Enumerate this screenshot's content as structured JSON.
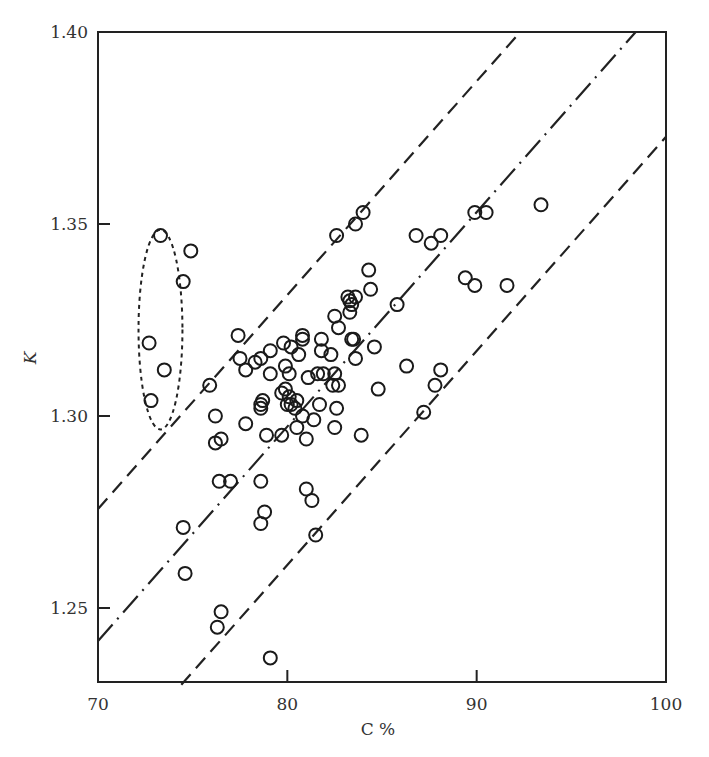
{
  "chart_data": {
    "type": "scatter",
    "title": "",
    "xlabel": "C %",
    "ylabel": "K",
    "xlim": [
      70,
      100
    ],
    "ylim": [
      1.23,
      1.4
    ],
    "x_ticks": [
      70,
      80,
      90,
      100
    ],
    "x_tick_labels": [
      "70",
      "80",
      "90",
      "100"
    ],
    "y_ticks": [
      1.25,
      1.3,
      1.35,
      1.4
    ],
    "y_tick_labels": [
      "1.25",
      "1.30",
      "1.35",
      "1.40"
    ],
    "grid": false,
    "legend": null,
    "marker": "open-circle",
    "series": [
      {
        "name": "outliers (circled)",
        "points": [
          [
            73.3,
            1.347
          ],
          [
            74.9,
            1.343
          ],
          [
            74.5,
            1.335
          ],
          [
            72.7,
            1.319
          ],
          [
            73.5,
            1.312
          ],
          [
            72.8,
            1.304
          ]
        ]
      },
      {
        "name": "data",
        "points": [
          [
            75.9,
            1.308
          ],
          [
            77.4,
            1.321
          ],
          [
            77.5,
            1.315
          ],
          [
            77.8,
            1.312
          ],
          [
            78.3,
            1.314
          ],
          [
            79.1,
            1.317
          ],
          [
            77.8,
            1.298
          ],
          [
            78.6,
            1.303
          ],
          [
            78.7,
            1.304
          ],
          [
            78.6,
            1.302
          ],
          [
            76.2,
            1.3
          ],
          [
            76.5,
            1.294
          ],
          [
            76.2,
            1.293
          ],
          [
            76.4,
            1.283
          ],
          [
            77.0,
            1.283
          ],
          [
            78.6,
            1.283
          ],
          [
            78.8,
            1.275
          ],
          [
            78.6,
            1.272
          ],
          [
            74.5,
            1.271
          ],
          [
            74.6,
            1.259
          ],
          [
            76.5,
            1.249
          ],
          [
            76.3,
            1.245
          ],
          [
            79.1,
            1.237
          ],
          [
            79.7,
            1.295
          ],
          [
            78.9,
            1.295
          ],
          [
            80.4,
            1.302
          ],
          [
            79.8,
            1.319
          ],
          [
            80.2,
            1.318
          ],
          [
            79.9,
            1.313
          ],
          [
            80.1,
            1.311
          ],
          [
            80.8,
            1.321
          ],
          [
            80.8,
            1.32
          ],
          [
            80.6,
            1.316
          ],
          [
            79.9,
            1.307
          ],
          [
            80.1,
            1.305
          ],
          [
            80.2,
            1.303
          ],
          [
            80.5,
            1.304
          ],
          [
            80.0,
            1.303
          ],
          [
            80.5,
            1.297
          ],
          [
            80.8,
            1.3
          ],
          [
            81.0,
            1.294
          ],
          [
            81.4,
            1.299
          ],
          [
            81.1,
            1.31
          ],
          [
            81.6,
            1.311
          ],
          [
            81.9,
            1.311
          ],
          [
            81.7,
            1.303
          ],
          [
            81.8,
            1.32
          ],
          [
            82.3,
            1.316
          ],
          [
            82.4,
            1.308
          ],
          [
            82.5,
            1.311
          ],
          [
            82.7,
            1.308
          ],
          [
            82.6,
            1.302
          ],
          [
            82.5,
            1.297
          ],
          [
            82.6,
            1.347
          ],
          [
            83.6,
            1.35
          ],
          [
            84.0,
            1.353
          ],
          [
            84.3,
            1.338
          ],
          [
            84.4,
            1.333
          ],
          [
            82.5,
            1.326
          ],
          [
            82.7,
            1.323
          ],
          [
            83.2,
            1.331
          ],
          [
            83.3,
            1.33
          ],
          [
            83.3,
            1.327
          ],
          [
            83.4,
            1.329
          ],
          [
            83.6,
            1.331
          ],
          [
            83.4,
            1.32
          ],
          [
            83.5,
            1.32
          ],
          [
            83.6,
            1.315
          ],
          [
            83.9,
            1.295
          ],
          [
            84.6,
            1.318
          ],
          [
            84.8,
            1.307
          ],
          [
            81.0,
            1.281
          ],
          [
            81.3,
            1.278
          ],
          [
            81.5,
            1.269
          ],
          [
            85.8,
            1.329
          ],
          [
            86.3,
            1.313
          ],
          [
            87.2,
            1.301
          ],
          [
            87.8,
            1.308
          ],
          [
            88.1,
            1.312
          ],
          [
            86.8,
            1.347
          ],
          [
            87.6,
            1.345
          ],
          [
            88.1,
            1.347
          ],
          [
            89.4,
            1.336
          ],
          [
            89.9,
            1.334
          ],
          [
            89.9,
            1.353
          ],
          [
            90.5,
            1.353
          ],
          [
            91.6,
            1.334
          ],
          [
            93.4,
            1.355
          ],
          [
            79.1,
            1.311
          ],
          [
            81.8,
            1.317
          ],
          [
            78.6,
            1.315
          ],
          [
            79.7,
            1.306
          ]
        ]
      }
    ],
    "reference_lines": [
      {
        "name": "upper bound",
        "style": "dashed",
        "from": [
          70,
          1.2758
        ],
        "to": [
          92.3,
          1.4
        ]
      },
      {
        "name": "regression center",
        "style": "dash-dot",
        "from": [
          70,
          1.2414
        ],
        "to": [
          98.4,
          1.4
        ]
      },
      {
        "name": "lower bound",
        "style": "dashed",
        "from": [
          74.4,
          1.23
        ],
        "to": [
          100,
          1.3727
        ]
      }
    ],
    "annotations": [
      {
        "type": "dotted-ellipse",
        "center": [
          73.3,
          1.3225
        ],
        "rx_units": 1.16,
        "ry_units": 0.026,
        "label": ""
      }
    ]
  }
}
